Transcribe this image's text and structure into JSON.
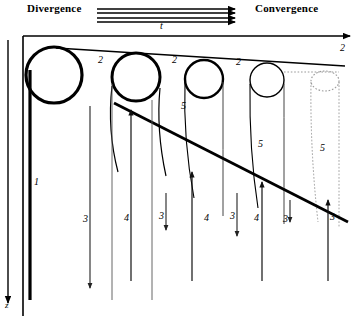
{
  "header": {
    "divergence_label": "Divergence",
    "convergence_label": "Convergence",
    "time_axis_label": "t",
    "arrow_count": 4
  },
  "axes": {
    "depth_axis_label": "z",
    "depth_axis_direction": "down",
    "time_axis_direction": "right"
  },
  "legend_numbers": {
    "n1": "1",
    "n2": "2",
    "n3": "3",
    "n4": "4",
    "n5": "5"
  },
  "labels": {
    "one_a": "1",
    "two_a": "2",
    "two_b": "2",
    "two_c": "2",
    "two_d": "2",
    "two_e": "2",
    "three_a": "3",
    "three_b": "3",
    "three_c": "3",
    "three_d": "3",
    "three_e": "3",
    "four_a": "4",
    "four_b": "4",
    "four_c": "4",
    "five_a": "5",
    "five_b": "5",
    "five_c": "5",
    "z_label": "z"
  },
  "colors": {
    "stroke": "#000000",
    "thin_stroke": "#333333",
    "dotted_stroke": "#888888",
    "background": "#ffffff"
  },
  "diagram": {
    "type": "schematic",
    "cells": [
      {
        "index": 1,
        "cx": 54,
        "cy": 75,
        "rx": 28,
        "ry": 28,
        "style": "thick-circle"
      },
      {
        "index": 2,
        "cx": 136,
        "cy": 77,
        "rx": 24,
        "ry": 24,
        "style": "thick-circle"
      },
      {
        "index": 3,
        "cx": 204,
        "cy": 79,
        "rx": 19,
        "ry": 19,
        "style": "thick-circle"
      },
      {
        "index": 4,
        "cx": 267,
        "cy": 80,
        "rx": 17,
        "ry": 17,
        "style": "thin-circle"
      },
      {
        "index": 5,
        "cx": 325,
        "cy": 81,
        "rx": 14,
        "ry": 10,
        "style": "dotted-ellipse"
      }
    ],
    "downward_arrows": [
      {
        "x": 8,
        "y1": 40,
        "y2": 306
      },
      {
        "x": 90,
        "y1": 106,
        "y2": 292
      },
      {
        "x": 166,
        "y1": 193,
        "y2": 234
      },
      {
        "x": 237,
        "y1": 193,
        "y2": 240
      },
      {
        "x": 290,
        "y1": 200,
        "y2": 225
      }
    ],
    "upward_arrows": [
      {
        "x": 131,
        "y1": 281,
        "y2": 106
      },
      {
        "x": 192,
        "y1": 281,
        "y2": 168
      },
      {
        "x": 262,
        "y1": 281,
        "y2": 178
      },
      {
        "x": 328,
        "y1": 281,
        "y2": 196
      }
    ]
  }
}
